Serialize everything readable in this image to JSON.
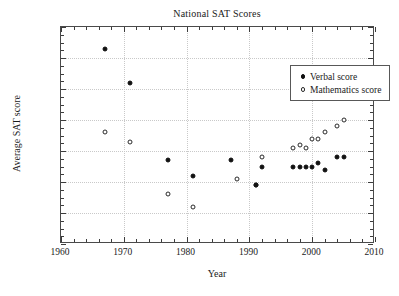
{
  "chart_data": {
    "type": "scatter",
    "title": "National SAT Scores",
    "xlabel": "Year",
    "ylabel": "Average SAT score",
    "xlim": [
      1960,
      2010
    ],
    "ylim": [
      480,
      550
    ],
    "xticks": [
      1960,
      1970,
      1980,
      1990,
      2000,
      2010
    ],
    "yticks": [
      480,
      490,
      500,
      510,
      520,
      530,
      540,
      550
    ],
    "xtick_labels": [
      "1960",
      "1970",
      "1980",
      "1990",
      "2000",
      "2010"
    ],
    "ytick_labels": [
      "480",
      "490",
      "500",
      "510",
      "520",
      "530",
      "540",
      "550"
    ],
    "x_minor_step": 2,
    "y_minor_step": 2.5,
    "grid": true,
    "legend_position": "upper right",
    "series": [
      {
        "name": "Verbal score",
        "marker": "filled-circle",
        "color": "#111111",
        "points": [
          {
            "x": 1967,
            "y": 543
          },
          {
            "x": 1971,
            "y": 532
          },
          {
            "x": 1977,
            "y": 507
          },
          {
            "x": 1981,
            "y": 502
          },
          {
            "x": 1987,
            "y": 507
          },
          {
            "x": 1991,
            "y": 499
          },
          {
            "x": 1992,
            "y": 505
          },
          {
            "x": 1997,
            "y": 505
          },
          {
            "x": 1998,
            "y": 505
          },
          {
            "x": 1999,
            "y": 505
          },
          {
            "x": 2000,
            "y": 505
          },
          {
            "x": 2001,
            "y": 506
          },
          {
            "x": 2002,
            "y": 504
          },
          {
            "x": 2004,
            "y": 508
          },
          {
            "x": 2005,
            "y": 508
          }
        ]
      },
      {
        "name": "Mathematics score",
        "marker": "open-circle",
        "color": "#2a2a2a",
        "points": [
          {
            "x": 1967,
            "y": 516
          },
          {
            "x": 1971,
            "y": 513
          },
          {
            "x": 1977,
            "y": 496
          },
          {
            "x": 1981,
            "y": 492
          },
          {
            "x": 1988,
            "y": 501
          },
          {
            "x": 1991,
            "y": 499
          },
          {
            "x": 1992,
            "y": 508
          },
          {
            "x": 1997,
            "y": 511
          },
          {
            "x": 1998,
            "y": 512
          },
          {
            "x": 1999,
            "y": 511
          },
          {
            "x": 2000,
            "y": 514
          },
          {
            "x": 2001,
            "y": 514
          },
          {
            "x": 2002,
            "y": 516
          },
          {
            "x": 2004,
            "y": 518
          },
          {
            "x": 2005,
            "y": 520
          }
        ]
      }
    ]
  },
  "legend": {
    "items": [
      {
        "label": "Verbal score",
        "marker": "filled-circle"
      },
      {
        "label": "Mathematics score",
        "marker": "open-circle"
      }
    ]
  }
}
